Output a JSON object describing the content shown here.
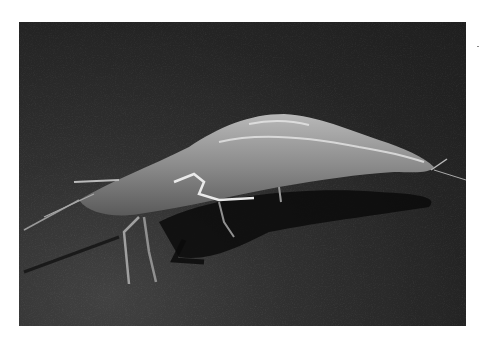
{
  "image": {
    "subject": "shrimp",
    "alt": "Photograph of a whole raw shrimp lying on a dark textured surface",
    "colors": {
      "background": "#ffffff",
      "surface": "#2a2a2a",
      "shrimp_body": "#9a9a9a",
      "highlight": "#e0e0e0",
      "shadow": "#0a0a0a"
    }
  }
}
